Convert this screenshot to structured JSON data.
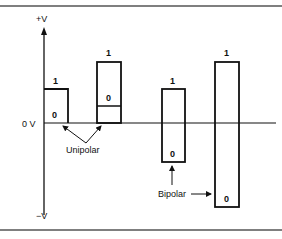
{
  "figure": {
    "axis_labels": {
      "positive": "+V",
      "zero": "0 V",
      "negative": "−V"
    },
    "callouts": {
      "unipolar": "Unipolar",
      "bipolar": "Bipolar"
    },
    "pulses": [
      {
        "id": "unipolar-1",
        "type": "unipolar",
        "top_label": "1",
        "bottom_label": "0"
      },
      {
        "id": "unipolar-2",
        "type": "unipolar",
        "top_label": "1",
        "bottom_label": "0"
      },
      {
        "id": "bipolar-1",
        "type": "bipolar",
        "top_label": "1",
        "bottom_label": "0"
      },
      {
        "id": "bipolar-2",
        "type": "bipolar",
        "top_label": "1",
        "bottom_label": "0"
      }
    ],
    "colors": {
      "line": "#111111",
      "frame": "#555555",
      "background": "#ffffff"
    }
  }
}
